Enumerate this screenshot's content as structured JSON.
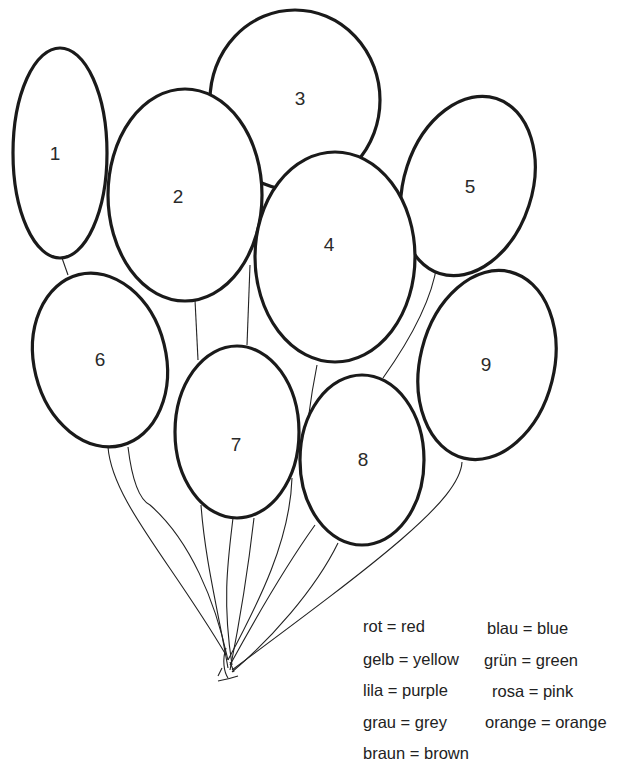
{
  "worksheet": {
    "title": "Balloon color-by-number",
    "balloons": [
      {
        "number": "1"
      },
      {
        "number": "2"
      },
      {
        "number": "3"
      },
      {
        "number": "4"
      },
      {
        "number": "5"
      },
      {
        "number": "6"
      },
      {
        "number": "7"
      },
      {
        "number": "8"
      },
      {
        "number": "9"
      }
    ],
    "legend": [
      {
        "text": "rot = red"
      },
      {
        "text": "blau = blue"
      },
      {
        "text": "gelb = yellow"
      },
      {
        "text": "grün = green"
      },
      {
        "text": "lila = purple"
      },
      {
        "text": "rosa = pink"
      },
      {
        "text": "grau = grey"
      },
      {
        "text": "orange = orange"
      },
      {
        "text": "braun = brown"
      }
    ]
  },
  "colors": {
    "outline": "#1a1a1a",
    "background": "#ffffff"
  }
}
